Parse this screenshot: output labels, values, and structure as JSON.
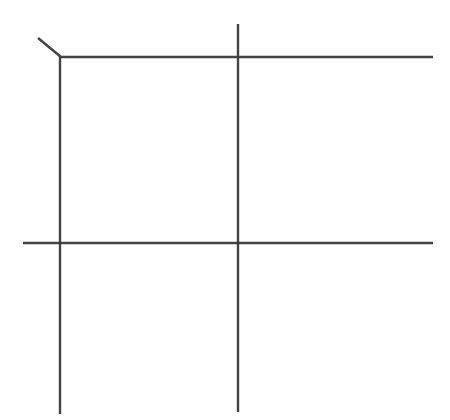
{
  "canvas": {
    "width": 450,
    "height": 420,
    "background_color": "#ffffff",
    "title": "Line Drawing"
  },
  "style": {
    "stroke_color": "#3a3a3a",
    "stroke_width": 2.4,
    "stroke_opacity": 0.95
  },
  "chart_data": {
    "type": "line",
    "title": "",
    "xlabel": "",
    "ylabel": "",
    "xlim": [
      0,
      450
    ],
    "ylim": [
      0,
      420
    ],
    "grid": false,
    "legend": "none",
    "series": [
      {
        "name": "vertical-line-left",
        "orientation": "vertical",
        "x": [
          60,
          60
        ],
        "y": [
          57,
          414
        ]
      },
      {
        "name": "vertical-line-center",
        "orientation": "vertical",
        "x": [
          238,
          238
        ],
        "y": [
          24,
          412
        ]
      },
      {
        "name": "horizontal-line-top",
        "orientation": "horizontal",
        "x": [
          60,
          433
        ],
        "y": [
          57,
          57
        ]
      },
      {
        "name": "horizontal-line-middle",
        "orientation": "horizontal",
        "x": [
          23,
          433
        ],
        "y": [
          243,
          243
        ]
      },
      {
        "name": "diagonal-tick-top-left",
        "orientation": "diagonal",
        "x": [
          38,
          61
        ],
        "y": [
          38,
          57
        ]
      }
    ],
    "intersections": [
      {
        "name": "top-left-corner",
        "x": 60,
        "y": 57
      },
      {
        "name": "top-center-crossing",
        "x": 238,
        "y": 57
      },
      {
        "name": "left-middle-crossing",
        "x": 60,
        "y": 243
      },
      {
        "name": "center-middle-crossing",
        "x": 238,
        "y": 243
      }
    ]
  }
}
